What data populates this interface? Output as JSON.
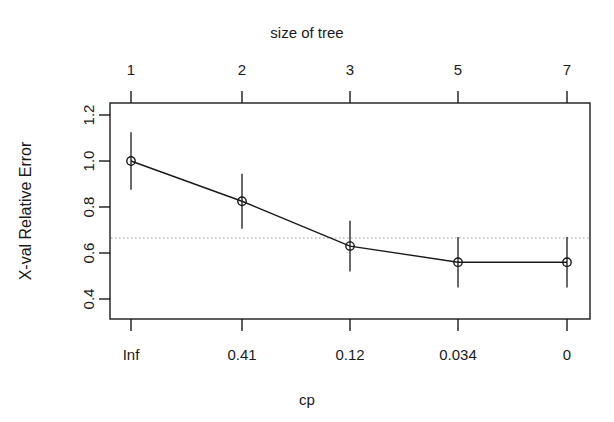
{
  "chart_data": {
    "type": "line",
    "title": "",
    "top_axis_label": "size of tree",
    "xlabel": "cp",
    "ylabel": "X-val Relative Error",
    "x_positions": [
      1,
      2,
      3,
      4,
      5
    ],
    "top_tick_labels": [
      "1",
      "2",
      "3",
      "5",
      "7"
    ],
    "bottom_tick_labels": [
      "Inf",
      "0.41",
      "0.12",
      "0.034",
      "0"
    ],
    "y_tick_labels": [
      "1.2",
      "1.0",
      "0.8",
      "0.6",
      "0.4"
    ],
    "y_tick_values": [
      1.2,
      1.0,
      0.8,
      0.6,
      0.4
    ],
    "ylim": [
      0.33,
      1.27
    ],
    "xlim": [
      0.5,
      5.5
    ],
    "grid": false,
    "legend": "none",
    "series": [
      {
        "name": "X-val Relative Error",
        "values": [
          1.0,
          0.825,
          0.63,
          0.56,
          0.56
        ],
        "errors_upper": [
          1.125,
          0.945,
          0.74,
          0.67,
          0.67
        ],
        "errors_lower": [
          0.875,
          0.705,
          0.52,
          0.45,
          0.45
        ],
        "marker": "open-circle",
        "color": "#1a1a1a"
      }
    ],
    "reference_line": {
      "value": 0.665,
      "style": "dotted",
      "color": "#9a9a9a"
    },
    "tree_sizes": [
      1,
      2,
      3,
      5,
      7
    ],
    "cp_values": [
      "Inf",
      "0.41",
      "0.12",
      "0.034",
      "0"
    ]
  },
  "axes": {
    "top_title": "size of tree",
    "bottom_title": "cp",
    "y_title": "X-val Relative Error"
  },
  "colors": {
    "frame": "#1a1a1a",
    "line": "#1a1a1a",
    "reference": "#9a9a9a",
    "background": "#ffffff"
  }
}
